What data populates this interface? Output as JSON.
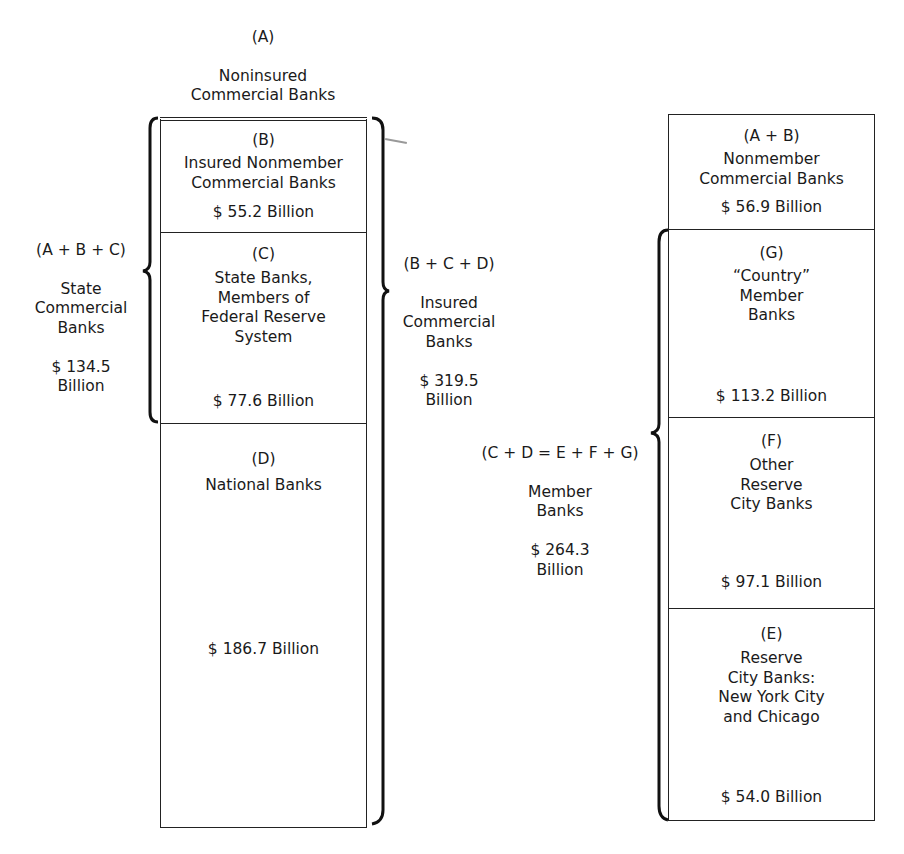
{
  "left_column": {
    "top_label": {
      "letter": "(A)",
      "name": "Noninsured\nCommercial Banks",
      "amount": "$ 1.7 Billion"
    },
    "segments": [
      {
        "letter": "(B)",
        "name": "Insured Nonmember\nCommercial Banks",
        "amount": "$ 55.2 Billion"
      },
      {
        "letter": "(C)",
        "name": "State Banks,\nMembers of\nFederal Reserve\nSystem",
        "amount": "$ 77.6 Billion"
      },
      {
        "letter": "(D)",
        "name": "National Banks",
        "amount": "$ 186.7 Billion"
      }
    ],
    "left_brace": {
      "formula": "(A + B + C)",
      "name": "State\nCommercial\nBanks",
      "amount": "$ 134.5\nBillion"
    },
    "right_brace": {
      "formula": "(B + C + D)",
      "name": "Insured\nCommercial\nBanks",
      "amount": "$ 319.5\nBillion"
    }
  },
  "right_column": {
    "segments": [
      {
        "letter": "(A + B)",
        "name": "Nonmember\nCommercial Banks",
        "amount": "$ 56.9 Billion"
      },
      {
        "letter": "(G)",
        "name": "“Country”\nMember\nBanks",
        "amount": "$ 113.2 Billion"
      },
      {
        "letter": "(F)",
        "name": "Other\nReserve\nCity Banks",
        "amount": "$ 97.1 Billion"
      },
      {
        "letter": "(E)",
        "name": "Reserve\nCity Banks:\nNew York City\nand Chicago",
        "amount": "$ 54.0 Billion"
      }
    ],
    "left_brace": {
      "formula": "(C + D = E + F + G)",
      "name": "Member\nBanks",
      "amount": "$ 264.3\nBillion"
    }
  },
  "colors": {
    "line": "#222222",
    "background": "#ffffff",
    "text": "#1a1a1a"
  }
}
